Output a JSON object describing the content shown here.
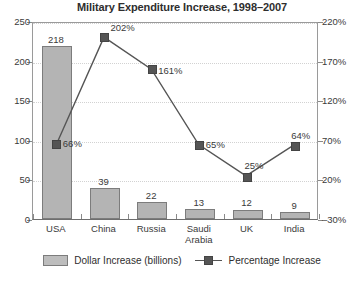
{
  "chart_data": {
    "type": "bar",
    "title": "Military Expenditure Increase, 1998–2007",
    "xlabel": "",
    "ylabel": "",
    "categories": [
      "USA",
      "China",
      "Russia",
      "Saudi Arabia",
      "UK",
      "India"
    ],
    "category_lines": [
      [
        "USA"
      ],
      [
        "China"
      ],
      [
        "Russia"
      ],
      [
        "Saudi",
        "Arabia"
      ],
      [
        "UK"
      ],
      [
        "India"
      ]
    ],
    "grid": true,
    "legend_position": "bottom",
    "series": [
      {
        "name": "Dollar Increase (billions)",
        "type": "bar",
        "axis": "left",
        "values": [
          218,
          39,
          22,
          13,
          12,
          9
        ],
        "labels": [
          "218",
          "39",
          "22",
          "13",
          "12",
          "9"
        ],
        "color": "#b4b4b4"
      },
      {
        "name": "Percentage Increase",
        "type": "line",
        "axis": "right",
        "values": [
          66,
          202,
          161,
          65,
          25,
          64
        ],
        "labels": [
          "66%",
          "202%",
          "161%",
          "65%",
          "25%",
          "64%"
        ],
        "color": "#555555"
      }
    ],
    "left_axis": {
      "ticks": [
        0,
        50,
        100,
        150,
        200,
        250
      ],
      "tick_labels": [
        "0",
        "50",
        "100",
        "150",
        "200",
        "250"
      ],
      "ylim": [
        0,
        250
      ]
    },
    "right_axis": {
      "ticks": [
        -30,
        20,
        70,
        120,
        170,
        220
      ],
      "tick_labels": [
        "–30%",
        "20%",
        "70%",
        "120%",
        "170%",
        "220%"
      ],
      "ylim": [
        -30,
        220
      ]
    }
  },
  "footer": {
    "partial_text": ""
  }
}
